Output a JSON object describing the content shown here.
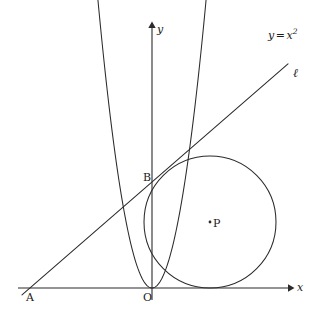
{
  "figure": {
    "background": "#ffffff",
    "stroke": "#2b2b2b",
    "width": 323,
    "height": 321
  },
  "axes": {
    "x_label": "x",
    "y_label": "y",
    "origin_label": "O",
    "x_axis": {
      "y": 288,
      "x_start": 18,
      "x_end": 292
    },
    "y_axis": {
      "x": 152,
      "y_top": 22,
      "y_bottom": 300
    }
  },
  "curves": {
    "parabola": {
      "name": "parabola",
      "equation_label": "y = x",
      "equation_exponent": "2",
      "vertex_px": [
        152,
        288
      ],
      "scale": 0.0985,
      "x_from_px": 41,
      "x_to_px": 266
    },
    "line": {
      "name": "line-ell",
      "label": "ℓ",
      "point_a_px": [
        30,
        288
      ],
      "point_b_px": [
        152,
        182
      ],
      "x_from_px": 22,
      "x_to_px": 288
    },
    "circle": {
      "name": "circle-p",
      "center_px": [
        210,
        222
      ],
      "radius_px": 66,
      "center_label": "P"
    }
  },
  "points": [
    {
      "id": "A",
      "label": "A",
      "x": 30,
      "y": 288,
      "label_x": 26,
      "label_y": 292
    },
    {
      "id": "O",
      "label": "O",
      "x": 152,
      "y": 288,
      "label_x": 143,
      "label_y": 292
    },
    {
      "id": "B",
      "label": "B",
      "x": 152,
      "y": 182,
      "label_x": 143,
      "label_y": 172
    },
    {
      "id": "P",
      "label": "P",
      "x": 210,
      "y": 222,
      "label_x": 213,
      "label_y": 218
    }
  ],
  "labels": {
    "y_axis": "y",
    "x_axis": "x",
    "origin": "O",
    "point_a": "A",
    "point_b": "B",
    "point_p": "P",
    "line_ell": "ℓ",
    "curve_eq_base": "y",
    "curve_eq_op": "=",
    "curve_eq_var": "x",
    "curve_eq_sup": "2"
  }
}
